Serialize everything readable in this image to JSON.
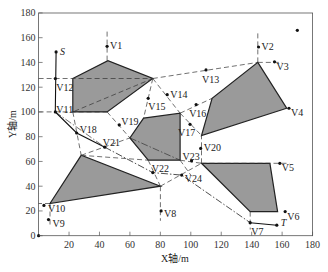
{
  "chart_data": {
    "type": "diagram",
    "title": "",
    "xlabel": "X轴/m",
    "ylabel": "Y轴/m",
    "xlim": [
      0,
      180
    ],
    "ylim": [
      0,
      180
    ],
    "x_ticks": [
      20,
      40,
      60,
      80,
      100,
      120,
      140,
      160,
      180
    ],
    "y_ticks": [
      0,
      20,
      40,
      60,
      80,
      100,
      120,
      140,
      160,
      180
    ],
    "x_tick_labels": [
      "20",
      "40",
      "60",
      "80",
      "100",
      "120",
      "140",
      "160",
      "180"
    ],
    "y_tick_labels": [
      "0",
      "20",
      "40",
      "60",
      "80",
      "100",
      "120",
      "140",
      "160",
      "180"
    ],
    "grid": false,
    "obstacles": [
      {
        "name": "obstacle-1",
        "points": [
          [
            22.5,
            127
          ],
          [
            45.5,
            141.5
          ],
          [
            75,
            127
          ],
          [
            45,
            100
          ],
          [
            22.5,
            100
          ]
        ]
      },
      {
        "name": "obstacle-2",
        "points": [
          [
            69,
            95
          ],
          [
            93,
            99
          ],
          [
            93,
            61
          ],
          [
            72,
            61
          ],
          [
            60,
            79
          ]
        ]
      },
      {
        "name": "obstacle-3",
        "points": [
          [
            144,
            140
          ],
          [
            163,
            103
          ],
          [
            107,
            81
          ],
          [
            114,
            111
          ]
        ]
      },
      {
        "name": "obstacle-4",
        "points": [
          [
            7.5,
            26
          ],
          [
            28,
            65
          ],
          [
            80,
            40
          ]
        ]
      },
      {
        "name": "obstacle-5",
        "points": [
          [
            107,
            58.5
          ],
          [
            152,
            58.5
          ],
          [
            157,
            19.5
          ],
          [
            139,
            19.5
          ]
        ]
      }
    ],
    "points": [
      {
        "label": "S",
        "x": 11.5,
        "y": 148.5,
        "italic": true,
        "dx": 4,
        "dy": 0
      },
      {
        "label": "T",
        "x": 156.5,
        "y": 8.5,
        "italic": true,
        "dx": 4,
        "dy": -2
      },
      {
        "label": "V1",
        "x": 45,
        "y": 153,
        "dx": 3,
        "dy": 0
      },
      {
        "label": "V2",
        "x": 144.5,
        "y": 152.5,
        "dx": 3,
        "dy": 0
      },
      {
        "label": "V3",
        "x": 155,
        "y": 140.5,
        "dx": 2,
        "dy": 5
      },
      {
        "label": "V4",
        "x": 164.5,
        "y": 103,
        "dx": 2,
        "dy": 5
      },
      {
        "label": "V5",
        "x": 158.5,
        "y": 58.5,
        "dx": 2,
        "dy": 5
      },
      {
        "label": "V6",
        "x": 162,
        "y": 19.5,
        "dx": 2,
        "dy": 5
      },
      {
        "label": "V7",
        "x": 139,
        "y": 10.5,
        "dx": 1,
        "dy": 9
      },
      {
        "label": "V8",
        "x": 80.5,
        "y": 20,
        "dx": 3,
        "dy": 3
      },
      {
        "label": "V9",
        "x": 6.5,
        "y": 13,
        "dx": 4,
        "dy": 4
      },
      {
        "label": "V10",
        "x": 3.5,
        "y": 24.5,
        "dx": 4,
        "dy": 4
      },
      {
        "label": "V11",
        "x": 11,
        "y": 100,
        "dx": 1,
        "dy": -2
      },
      {
        "label": "V12",
        "x": 11,
        "y": 127,
        "dx": 1,
        "dy": 9
      },
      {
        "label": "V13",
        "x": 110,
        "y": 134,
        "dx": -4,
        "dy": 10
      },
      {
        "label": "V14",
        "x": 84.5,
        "y": 114,
        "dx": 3,
        "dy": 0
      },
      {
        "label": "V15",
        "x": 72,
        "y": 111,
        "dx": 0,
        "dy": 9
      },
      {
        "label": "V16",
        "x": 103.5,
        "y": 106,
        "dx": -7,
        "dy": 9
      },
      {
        "label": "V17",
        "x": 99.5,
        "y": 90,
        "dx": -12,
        "dy": 9
      },
      {
        "label": "V18",
        "x": 25,
        "y": 83,
        "dx": 3,
        "dy": -3
      },
      {
        "label": "V19",
        "x": 53,
        "y": 89.5,
        "dx": 2,
        "dy": -3
      },
      {
        "label": "V20",
        "x": 106.5,
        "y": 70.5,
        "dx": 3,
        "dy": 0
      },
      {
        "label": "V21",
        "x": 43.5,
        "y": 71.5,
        "dx": -2,
        "dy": -4
      },
      {
        "label": "V22",
        "x": 75,
        "y": 51,
        "dx": -1,
        "dy": -4
      },
      {
        "label": "V23",
        "x": 100.5,
        "y": 60.5,
        "dx": -9,
        "dy": -4
      },
      {
        "label": "V24",
        "x": 94,
        "y": 49,
        "dx": 3,
        "dy": 4
      }
    ],
    "solid_path": [
      [
        11.5,
        148.5
      ],
      [
        11,
        100
      ],
      [
        25,
        83
      ],
      [
        43.5,
        71.5
      ]
    ],
    "solid_path_end": [
      [
        139,
        10.5
      ],
      [
        156.5,
        8.5
      ]
    ],
    "dashdot_path": [
      [
        43.5,
        71.5
      ],
      [
        75,
        51
      ],
      [
        94,
        49
      ],
      [
        139,
        10.5
      ]
    ],
    "dashed_lines": [
      [
        [
          0,
          127
        ],
        [
          75,
          127
        ]
      ],
      [
        [
          0,
          100
        ],
        [
          45,
          100
        ]
      ],
      [
        [
          75,
          127
        ],
        [
          144,
          140
        ]
      ],
      [
        [
          144,
          140
        ],
        [
          160,
          140
        ]
      ],
      [
        [
          144,
          140
        ],
        [
          144,
          165
        ]
      ],
      [
        [
          45,
          141.5
        ],
        [
          45,
          165
        ]
      ],
      [
        [
          75,
          127
        ],
        [
          22.5,
          100
        ]
      ],
      [
        [
          45,
          100
        ],
        [
          60,
          79
        ]
      ],
      [
        [
          75,
          127
        ],
        [
          69,
          95
        ]
      ],
      [
        [
          75,
          127
        ],
        [
          93,
          99
        ]
      ],
      [
        [
          93,
          99
        ],
        [
          114,
          111
        ]
      ],
      [
        [
          93,
          99
        ],
        [
          107,
          81
        ]
      ],
      [
        [
          22.5,
          100
        ],
        [
          28,
          65
        ]
      ],
      [
        [
          28,
          65
        ],
        [
          60,
          79
        ]
      ],
      [
        [
          28,
          65
        ],
        [
          72,
          61
        ]
      ],
      [
        [
          72,
          61
        ],
        [
          80,
          40
        ]
      ],
      [
        [
          80,
          40
        ],
        [
          80,
          12
        ]
      ],
      [
        [
          80,
          40
        ],
        [
          107,
          58.5
        ]
      ],
      [
        [
          107,
          58.5
        ],
        [
          107,
          81
        ]
      ],
      [
        [
          93,
          61
        ],
        [
          107,
          58.5
        ]
      ],
      [
        [
          107,
          58.5
        ],
        [
          165,
          58.5
        ]
      ],
      [
        [
          139,
          19.5
        ],
        [
          139,
          5
        ]
      ],
      [
        [
          7.5,
          26
        ],
        [
          7.5,
          8
        ]
      ],
      [
        [
          7.5,
          26
        ],
        [
          0,
          26
        ]
      ],
      [
        [
          93,
          61
        ],
        [
          100,
          49
        ]
      ]
    ],
    "dashdot_lines": [
      [
        [
          11,
          100
        ],
        [
          43.5,
          71.5
        ]
      ],
      [
        [
          60,
          79
        ],
        [
          93,
          61
        ]
      ]
    ],
    "lone_marker": [
      170,
      166
    ]
  }
}
